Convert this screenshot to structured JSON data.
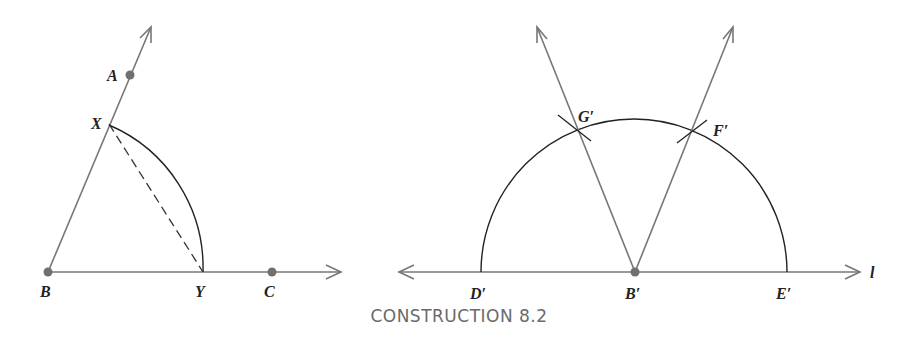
{
  "caption": "CONSTRUCTION 8.2",
  "colors": {
    "ray": "#777777",
    "arc": "#222222",
    "point": "#707070",
    "label": "#222222",
    "caption": "#6a6a6a"
  },
  "left_figure": {
    "points": {
      "A": "A",
      "X": "X",
      "B": "B",
      "Y": "Y",
      "C": "C"
    },
    "elements": [
      "ray BA",
      "ray BC",
      "arc XY centered at B",
      "dashed segment XY"
    ]
  },
  "right_figure": {
    "points": {
      "G": "G′",
      "F": "F′",
      "D": "D′",
      "B": "B′",
      "E": "E′"
    },
    "line_label": "l",
    "elements": [
      "line l",
      "semicircle centered at B′",
      "ray B′G′",
      "ray B′F′",
      "arc marks at G′ and F′"
    ]
  }
}
